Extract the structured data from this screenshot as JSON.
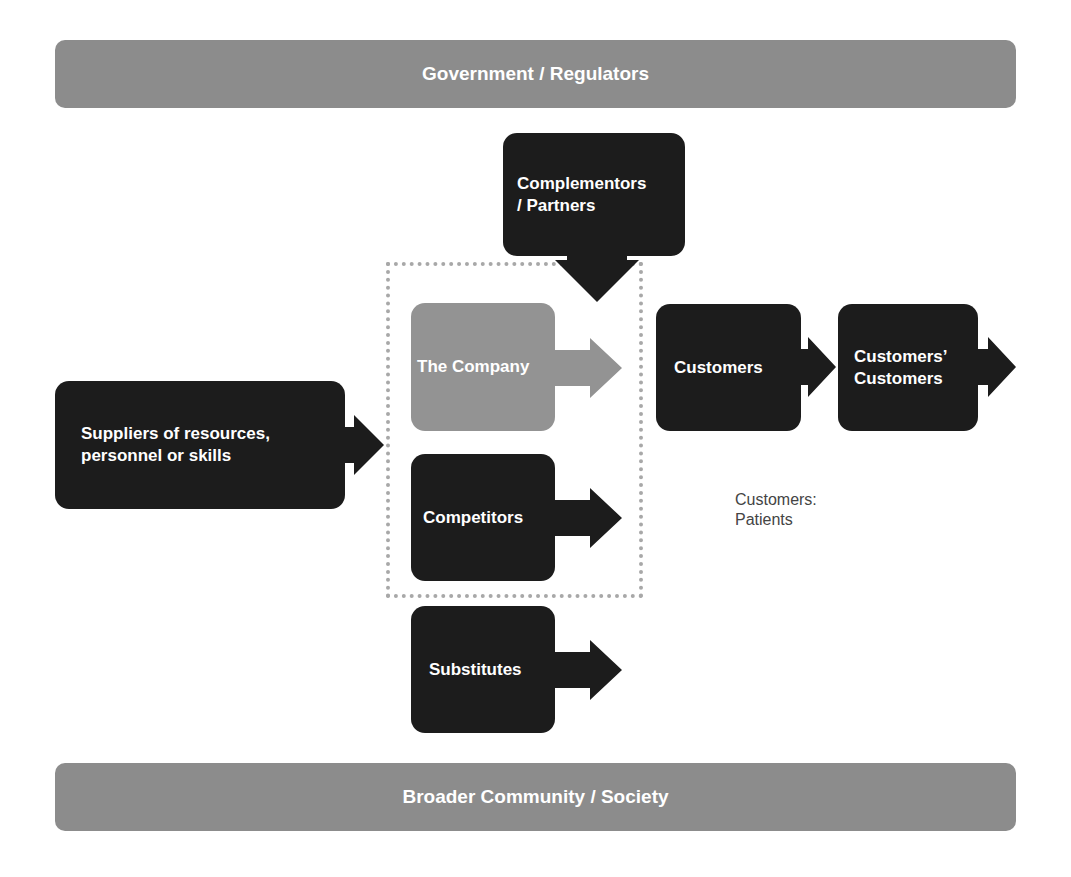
{
  "diagram": {
    "top_bar": {
      "label": "Government / Regulators"
    },
    "bottom_bar": {
      "label": "Broader Community / Society"
    },
    "nodes": {
      "complementors": {
        "line1": "Complementors",
        "line2": "/ Partners"
      },
      "company": {
        "label": "The Company"
      },
      "suppliers": {
        "line1": "Suppliers of resources,",
        "line2": "personnel or skills"
      },
      "competitors": {
        "label": "Competitors"
      },
      "substitutes": {
        "label": "Substitutes"
      },
      "customers": {
        "label": "Customers"
      },
      "customers_customers": {
        "line1": "Customers’",
        "line2": "Customers"
      }
    },
    "note": {
      "line1": "Customers:",
      "line2": "Patients"
    },
    "colors": {
      "dark_box": "#1c1c1c",
      "company_box": "#939393",
      "bars": "#8c8c8c",
      "dotted_border": "#a8a8a8"
    }
  }
}
